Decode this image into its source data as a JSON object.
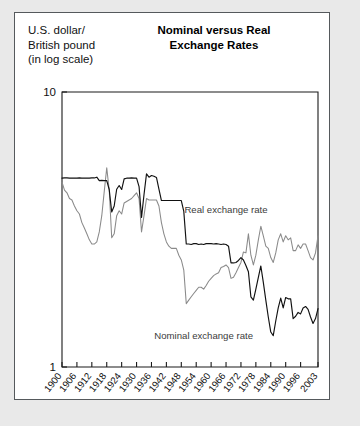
{
  "figure": {
    "axis_caption": "U.S. dollar/\nBritish pound\n(in log scale)",
    "title": "Nominal versus Real\nExchange Rates"
  },
  "colors": {
    "nominal_line": "#111111",
    "real_line": "#8a8a8a",
    "frame": "#1a1a1a",
    "card_background": "#ffffff",
    "page_background": "#e9e9e9",
    "card_border": "#55595c"
  },
  "annotations": [
    {
      "name": "real-exchange-rate-label",
      "text": "Real exchange rate",
      "x": 1966,
      "y": 3.62
    },
    {
      "name": "nominal-exchange-rate-label",
      "text": "Nominal exchange rate",
      "x": 1957,
      "y": 1.26
    }
  ],
  "chart_data": {
    "type": "line",
    "title": "Nominal versus Real Exchange Rates",
    "xlabel": "",
    "ylabel": "U.S. dollar/British pound (in log scale)",
    "yscale": "log",
    "ylim": [
      1,
      10
    ],
    "yticks": [
      1,
      10
    ],
    "ytick_labels": [
      "1",
      "10"
    ],
    "xlim": [
      1900,
      2003
    ],
    "xticks": [
      1900,
      1906,
      1912,
      1918,
      1924,
      1930,
      1936,
      1942,
      1948,
      1954,
      1960,
      1966,
      1972,
      1978,
      1984,
      1990,
      1996,
      2003
    ],
    "xtick_labels": [
      "1900",
      "1906",
      "1912",
      "1918",
      "1924",
      "1930",
      "1936",
      "1942",
      "1948",
      "1954",
      "1960",
      "1966",
      "1972",
      "1978",
      "1984",
      "1990",
      "1996",
      "2003"
    ],
    "grid": false,
    "legend": "inline-annotations",
    "series": [
      {
        "name": "Nominal exchange rate",
        "color": "#111111",
        "x": [
          1900,
          1901,
          1902,
          1903,
          1904,
          1905,
          1906,
          1907,
          1908,
          1909,
          1910,
          1911,
          1912,
          1913,
          1914,
          1915,
          1916,
          1917,
          1918,
          1919,
          1920,
          1921,
          1922,
          1923,
          1924,
          1925,
          1926,
          1927,
          1928,
          1929,
          1930,
          1931,
          1932,
          1933,
          1934,
          1935,
          1936,
          1937,
          1938,
          1939,
          1940,
          1941,
          1942,
          1943,
          1944,
          1945,
          1946,
          1947,
          1948,
          1949,
          1950,
          1951,
          1952,
          1953,
          1954,
          1955,
          1956,
          1957,
          1958,
          1959,
          1960,
          1961,
          1962,
          1963,
          1964,
          1965,
          1966,
          1967,
          1968,
          1969,
          1970,
          1971,
          1972,
          1973,
          1974,
          1975,
          1976,
          1977,
          1978,
          1979,
          1980,
          1981,
          1982,
          1983,
          1984,
          1985,
          1986,
          1987,
          1988,
          1989,
          1990,
          1991,
          1992,
          1993,
          1994,
          1995,
          1996,
          1997,
          1998,
          1999,
          2000,
          2001,
          2002,
          2003
        ],
        "y": [
          4.86,
          4.87,
          4.87,
          4.86,
          4.86,
          4.86,
          4.86,
          4.87,
          4.86,
          4.86,
          4.86,
          4.86,
          4.87,
          4.87,
          4.9,
          4.76,
          4.77,
          4.76,
          4.76,
          4.42,
          3.66,
          3.85,
          4.43,
          4.57,
          4.42,
          4.83,
          4.86,
          4.86,
          4.87,
          4.86,
          4.86,
          4.53,
          3.5,
          4.24,
          5.04,
          4.9,
          4.97,
          4.94,
          4.89,
          4.43,
          4.03,
          4.03,
          4.03,
          4.03,
          4.03,
          4.03,
          4.03,
          4.03,
          4.03,
          3.68,
          2.8,
          2.8,
          2.79,
          2.81,
          2.81,
          2.79,
          2.8,
          2.79,
          2.81,
          2.81,
          2.81,
          2.8,
          2.81,
          2.8,
          2.79,
          2.8,
          2.79,
          2.75,
          2.39,
          2.39,
          2.4,
          2.44,
          2.5,
          2.45,
          2.34,
          2.22,
          1.8,
          1.75,
          1.92,
          2.12,
          2.33,
          2.03,
          1.75,
          1.52,
          1.34,
          1.3,
          1.47,
          1.64,
          1.78,
          1.64,
          1.79,
          1.77,
          1.77,
          1.5,
          1.53,
          1.58,
          1.56,
          1.64,
          1.66,
          1.62,
          1.52,
          1.44,
          1.5,
          1.63
        ]
      },
      {
        "name": "Real exchange rate",
        "color": "#8a8a8a",
        "x": [
          1900,
          1901,
          1902,
          1903,
          1904,
          1905,
          1906,
          1907,
          1908,
          1909,
          1910,
          1911,
          1912,
          1913,
          1914,
          1915,
          1916,
          1917,
          1918,
          1919,
          1920,
          1921,
          1922,
          1923,
          1924,
          1925,
          1926,
          1927,
          1928,
          1929,
          1930,
          1931,
          1932,
          1933,
          1934,
          1935,
          1936,
          1937,
          1938,
          1939,
          1940,
          1941,
          1942,
          1943,
          1944,
          1945,
          1946,
          1947,
          1948,
          1949,
          1950,
          1951,
          1952,
          1953,
          1954,
          1955,
          1956,
          1957,
          1958,
          1959,
          1960,
          1961,
          1962,
          1963,
          1964,
          1965,
          1966,
          1967,
          1968,
          1969,
          1970,
          1971,
          1972,
          1973,
          1974,
          1975,
          1976,
          1977,
          1978,
          1979,
          1980,
          1981,
          1982,
          1983,
          1984,
          1985,
          1986,
          1987,
          1988,
          1989,
          1990,
          1991,
          1992,
          1993,
          1994,
          1995,
          1996,
          1997,
          1998,
          1999,
          2000,
          2001,
          2002,
          2003
        ],
        "y": [
          4.7,
          4.4,
          4.3,
          4.1,
          4.05,
          3.85,
          3.7,
          3.6,
          3.35,
          3.2,
          3.05,
          2.9,
          2.8,
          2.8,
          2.85,
          3.1,
          3.55,
          4.35,
          5.3,
          4.4,
          2.95,
          3.05,
          3.55,
          3.7,
          3.6,
          3.95,
          4.0,
          4.05,
          4.1,
          4.2,
          4.3,
          4.1,
          3.1,
          3.55,
          4.1,
          4.05,
          4.05,
          4.05,
          4.05,
          3.85,
          3.35,
          3.05,
          2.85,
          2.75,
          2.7,
          2.7,
          2.7,
          2.55,
          2.45,
          2.25,
          1.7,
          1.75,
          1.8,
          1.85,
          1.9,
          1.95,
          1.95,
          1.92,
          1.98,
          2.05,
          2.1,
          2.15,
          2.18,
          2.2,
          2.3,
          2.32,
          2.35,
          2.3,
          2.1,
          2.12,
          2.2,
          2.3,
          2.4,
          2.62,
          2.6,
          3.05,
          2.55,
          2.35,
          2.55,
          2.9,
          3.25,
          3.0,
          2.75,
          2.7,
          2.5,
          2.4,
          2.6,
          2.9,
          3.05,
          2.85,
          3.0,
          2.9,
          2.95,
          2.65,
          2.65,
          2.78,
          2.7,
          2.8,
          2.8,
          2.65,
          2.5,
          2.45,
          2.6,
          3.0
        ]
      }
    ]
  }
}
